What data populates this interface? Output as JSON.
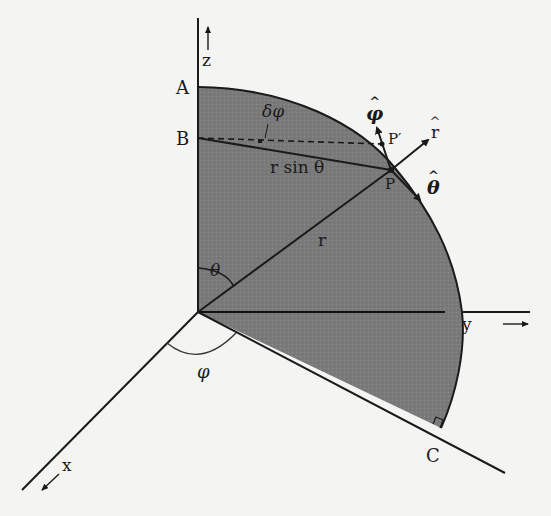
{
  "figure": {
    "colors": {
      "background": "#f4f4f2",
      "shaded_region": "#7c7c7c",
      "lines": "#1a1a1a"
    }
  },
  "labels": {
    "z_axis": "z",
    "y_axis": "y",
    "x_axis": "x",
    "point_A": "A",
    "point_B": "B",
    "point_C": "C",
    "point_P": "P",
    "point_P_prime": "P′",
    "delta_phi": "δφ",
    "r_sin_theta": "r sin θ",
    "radius": "r",
    "theta": "θ",
    "phi": "φ",
    "unit_r": "r",
    "unit_theta": "θ",
    "unit_phi": "φ"
  }
}
